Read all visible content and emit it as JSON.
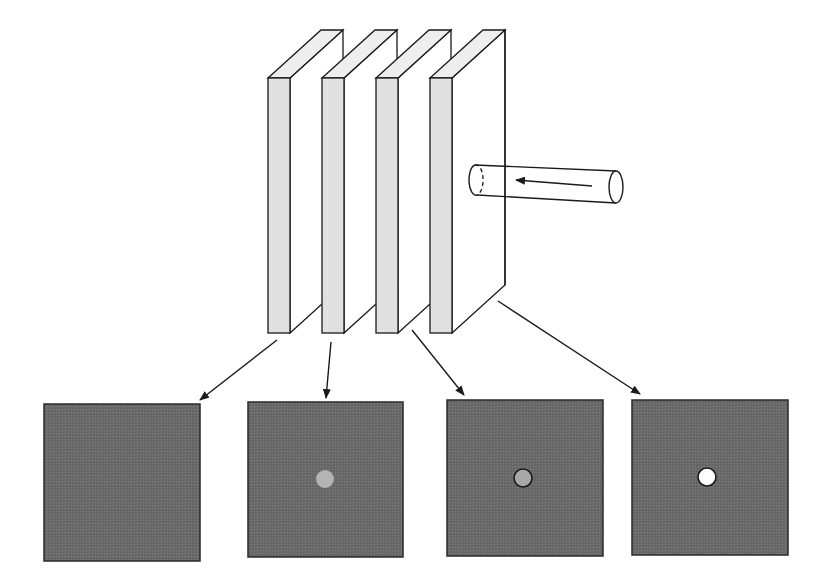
{
  "diagram": {
    "colors": {
      "background": "#ffffff",
      "stroke": "#1a1a1a",
      "plate_front": "#e2e2e2",
      "plate_side": "#ffffff",
      "plate_top": "#eeeeee",
      "panel_fill": "#6a6a6a",
      "panel_border": "#2a2a2a"
    },
    "beam": {
      "label": "incident beam",
      "direction": "right-to-left"
    },
    "plates": [
      {
        "index": 1,
        "x": 268
      },
      {
        "index": 2,
        "x": 322
      },
      {
        "index": 3,
        "x": 376
      },
      {
        "index": 4,
        "x": 430
      }
    ],
    "panels": [
      {
        "index": 1,
        "x": 44,
        "y": 404,
        "w": 156,
        "h": 157,
        "spot": null
      },
      {
        "index": 2,
        "x": 248,
        "y": 402,
        "w": 155,
        "h": 155,
        "spot": {
          "cx": 325,
          "cy": 479,
          "r": 9,
          "fill": "#b4b4b4",
          "outlined": false
        }
      },
      {
        "index": 3,
        "x": 447,
        "y": 400,
        "w": 156,
        "h": 156,
        "spot": {
          "cx": 523,
          "cy": 478,
          "r": 9,
          "fill": "#a8a8a8",
          "outlined": true
        }
      },
      {
        "index": 4,
        "x": 632,
        "y": 400,
        "w": 156,
        "h": 155,
        "spot": {
          "cx": 707,
          "cy": 477,
          "r": 9,
          "fill": "#ffffff",
          "outlined": true
        }
      }
    ],
    "arrows": [
      {
        "from": [
          277,
          340
        ],
        "to": [
          200,
          400
        ]
      },
      {
        "from": [
          331,
          342
        ],
        "to": [
          326,
          398
        ]
      },
      {
        "from": [
          412,
          330
        ],
        "to": [
          464,
          395
        ]
      },
      {
        "from": [
          498,
          301
        ],
        "to": [
          640,
          394
        ]
      }
    ]
  }
}
